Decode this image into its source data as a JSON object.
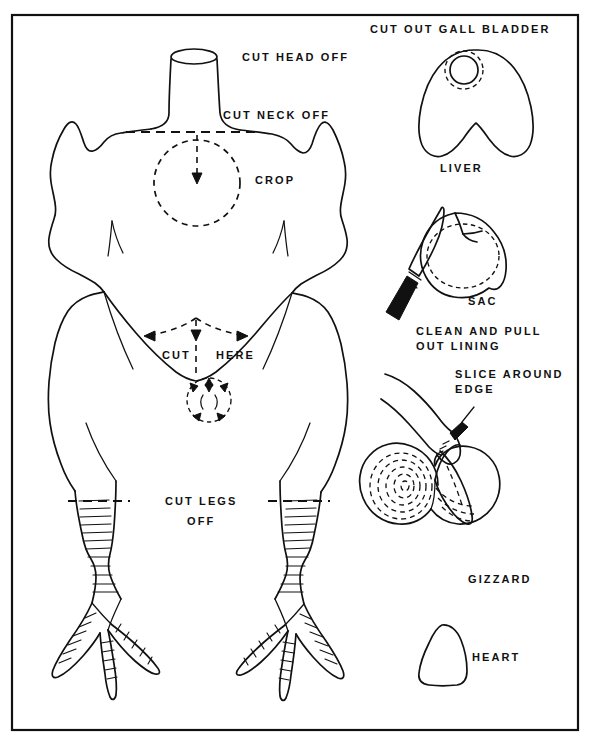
{
  "figure": {
    "background_color": "#ffffff",
    "ink_color": "#111111",
    "border": {
      "name": "plate-border",
      "x": 12,
      "y": 15,
      "width": 566,
      "height": 715
    },
    "caption": ""
  },
  "labels": {
    "cut_head_off": "CUT HEAD OFF",
    "cut_neck_off": "CUT NECK OFF",
    "crop": "CROP",
    "cut": "CUT",
    "here": "HERE",
    "cut_legs": "CUT LEGS",
    "off": "OFF",
    "cut_out_gall_bladder": "CUT OUT GALL BLADDER",
    "liver": "LIVER",
    "sac": "SAC",
    "clean_and_pull": "CLEAN AND PULL",
    "out_lining": "OUT LINING",
    "slice_around": "SLICE AROUND",
    "edge": "EDGE",
    "gizzard": "GIZZARD",
    "heart": "HEART"
  },
  "panels": [
    {
      "id": "carcass",
      "name": "chicken-carcass-panel",
      "labels": [
        "CUT HEAD OFF",
        "CUT NECK OFF",
        "CROP",
        "CUT",
        "HERE",
        "CUT LEGS",
        "OFF"
      ],
      "guides": [
        {
          "type": "dashed-line",
          "name": "neck-cut-line",
          "note": "horizontal dashed cut line across base of neck"
        },
        {
          "type": "dashed-circle",
          "name": "crop-circle",
          "note": "dashed circle marking crop location with arrow pointing in"
        },
        {
          "type": "dashed-arrows",
          "name": "cut-here-arrows",
          "note": "V-shaped dashed arrows spreading left and right plus downward arrow"
        },
        {
          "type": "dashed-circle",
          "name": "vent-circle",
          "note": "small dashed circle with radiating arrows at vent"
        },
        {
          "type": "dashed-line",
          "name": "left-leg-cut-line",
          "note": "horizontal dashed line across left leg"
        },
        {
          "type": "dashed-line",
          "name": "right-leg-cut-line",
          "note": "horizontal dashed line across right leg"
        }
      ]
    },
    {
      "id": "liver",
      "name": "liver-panel",
      "labels": [
        "CUT OUT GALL BLADDER",
        "LIVER"
      ],
      "guides": [
        {
          "type": "dashed-circle",
          "name": "gall-bladder-circle",
          "note": "dashed ring around gall bladder on liver lobe"
        }
      ]
    },
    {
      "id": "sac",
      "name": "sac-panel",
      "labels": [
        "SAC",
        "CLEAN AND PULL",
        "OUT LINING"
      ],
      "guides": [
        {
          "type": "dash-dot-circle",
          "name": "sac-lining-circle",
          "note": "dash-dot inner circle indicating lining"
        },
        {
          "type": "object",
          "name": "knife-icon",
          "note": "knife with dark handle pointing up-right"
        }
      ]
    },
    {
      "id": "gizzard",
      "name": "gizzard-panel",
      "labels": [
        "SLICE AROUND",
        "EDGE",
        "GIZZARD"
      ],
      "guides": [
        {
          "type": "object",
          "name": "hand-icon",
          "note": "hand holding gizzard with knife"
        },
        {
          "type": "dashed-spiral",
          "name": "gizzard-rings",
          "note": "concentric dashed rings showing gizzard interior"
        }
      ]
    },
    {
      "id": "heart",
      "name": "heart-panel",
      "labels": [
        "HEART"
      ],
      "guides": []
    }
  ]
}
